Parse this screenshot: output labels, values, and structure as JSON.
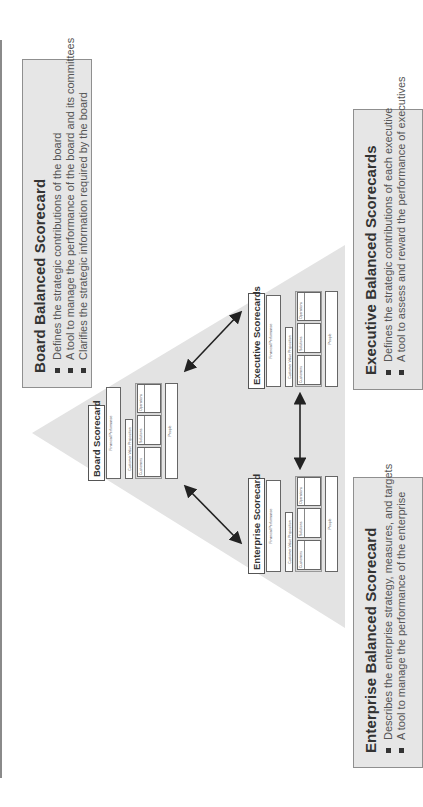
{
  "boxes": {
    "board": {
      "title": "Board Balanced Scorecard",
      "bullets": [
        "Defines the strategic contributions of the board",
        "A tool to manage the performance of the board and its committees",
        "Clarifies the strategic information required by the board"
      ]
    },
    "enterprise": {
      "title": "Enterprise Balanced Scorecard",
      "bullets": [
        "Describes the enterprise strategy, measures, and targets",
        "A tool to manage the performance of the enterprise"
      ]
    },
    "executive": {
      "title": "Executive Balanced Scorecards",
      "bullets": [
        "Defines the strategic contributions of each executive",
        "A tool to assess and reward the performance of executives"
      ]
    }
  },
  "cards": {
    "board": {
      "title": "Board Scorecard"
    },
    "enterprise": {
      "title": "Enterprise Scorecard"
    },
    "executive": {
      "title": "Executive Scorecards"
    }
  },
  "card_labels": {
    "financial": "Financial Performance",
    "cvp": "Customer Value Proposition",
    "customers": "Customers",
    "solutions": "Solutions",
    "operations": "Operations",
    "people": "People"
  },
  "colors": {
    "triangle": "#e3e3e3",
    "box_fill": "#e6e6e6",
    "box_border": "#8f8f8f",
    "arrow": "#222222"
  }
}
